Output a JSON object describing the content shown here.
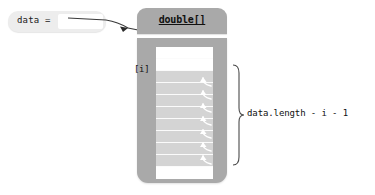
{
  "diagram": {
    "variable": {
      "name": "data =",
      "slot_value": "",
      "icon": "reference-slot"
    },
    "array_object": {
      "type_label": "double[]",
      "index_label": "[i]",
      "cells": [
        {
          "state": "empty",
          "has_shift_arrow": false
        },
        {
          "state": "empty",
          "has_shift_arrow": false
        },
        {
          "state": "filled",
          "has_shift_arrow": true
        },
        {
          "state": "filled",
          "has_shift_arrow": true
        },
        {
          "state": "filled",
          "has_shift_arrow": true
        },
        {
          "state": "filled",
          "has_shift_arrow": true
        },
        {
          "state": "filled",
          "has_shift_arrow": true
        },
        {
          "state": "filled",
          "has_shift_arrow": true
        },
        {
          "state": "filled",
          "has_shift_arrow": true
        },
        {
          "state": "filled",
          "has_shift_arrow": true
        },
        {
          "state": "empty",
          "has_shift_arrow": false
        }
      ]
    },
    "range_annotation": {
      "label": "data.length - i - 1",
      "brace_icon": "curly-brace-right"
    },
    "pointer": {
      "icon": "reference-arrow",
      "from": "data =",
      "to": "double[]"
    },
    "colors": {
      "object_gray": "#a9a9a9",
      "cell_fill": "#d4d4d4",
      "cell_empty": "#ffffff",
      "var_box": "#ededed",
      "text": "#111111",
      "background": "#ffffff"
    }
  }
}
